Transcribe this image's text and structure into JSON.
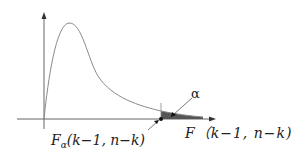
{
  "figure": {
    "type": "F-distribution density with right-tail rejection region",
    "x_axis_label": "F（k−1, n−k)",
    "critical_value_label": {
      "main": "F",
      "subscript": "α",
      "args": "(k−1, n−k)"
    },
    "tail_area_label": "α",
    "colors": {
      "curve": "#8a8a8a",
      "axes": "#666666",
      "shaded_tail": "#555555",
      "text": "#222222"
    }
  }
}
